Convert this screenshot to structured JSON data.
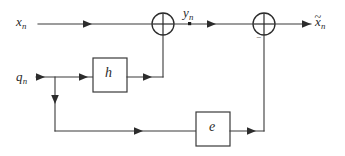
{
  "diagram": {
    "canvas": {
      "width": 345,
      "height": 156,
      "background": "#ffffff"
    },
    "line_color": "#3a3a3a",
    "text_color": "#2b2b2b",
    "signals": {
      "input_x": {
        "base": "x",
        "subscript": "n",
        "label": "x_n"
      },
      "mid_y": {
        "base": "y",
        "subscript": "n",
        "label": "y_n"
      },
      "output_xtilde": {
        "base": "x",
        "accent": "~",
        "subscript": "n",
        "label": "x̃_n"
      },
      "input_q": {
        "base": "q",
        "subscript": "n",
        "label": "q_n"
      }
    },
    "blocks": [
      {
        "name": "filter-h",
        "label": "h",
        "x": 93,
        "y": 58,
        "w": 34,
        "h": 34
      },
      {
        "name": "filter-e",
        "label": "e",
        "x": 196,
        "y": 112,
        "w": 34,
        "h": 34
      }
    ],
    "adders": [
      {
        "name": "adder-1",
        "cx": 163,
        "cy": 24,
        "r": 11,
        "glyph": "cross"
      },
      {
        "name": "adder-2",
        "cx": 264,
        "cy": 24,
        "r": 11,
        "glyph": "cross",
        "sign": "−"
      }
    ],
    "junction_dots": [
      {
        "name": "node-yn",
        "cx": 190,
        "cy": 24
      }
    ],
    "sign_marker": "−",
    "accent_glyph": "˜"
  }
}
